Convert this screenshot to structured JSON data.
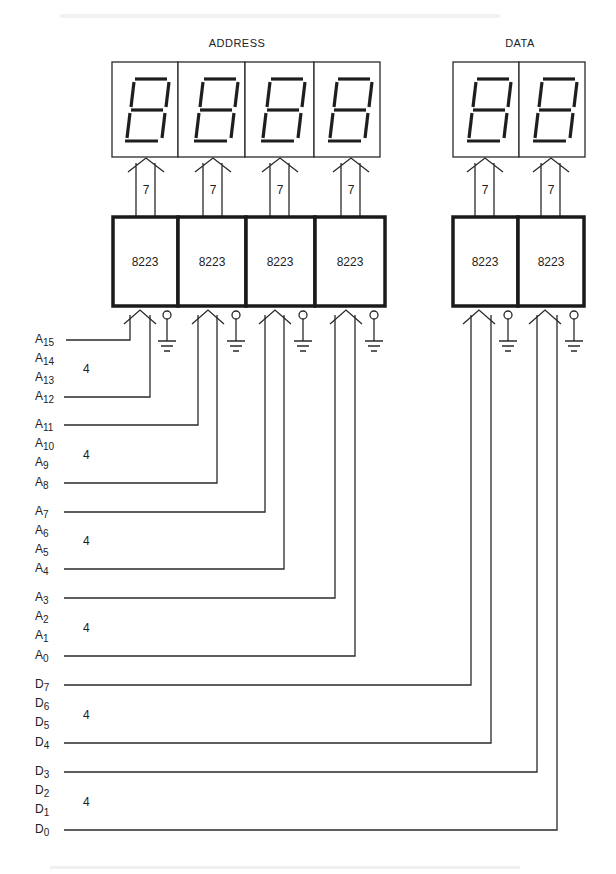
{
  "diagram": {
    "groups": {
      "address": {
        "label": "ADDRESS"
      },
      "data": {
        "label": "DATA"
      }
    },
    "displays": [
      {
        "group": "address",
        "digit": "8",
        "segments": "7-segment"
      },
      {
        "group": "address",
        "digit": "8",
        "segments": "7-segment"
      },
      {
        "group": "address",
        "digit": "8",
        "segments": "7-segment"
      },
      {
        "group": "address",
        "digit": "8",
        "segments": "7-segment"
      },
      {
        "group": "data",
        "digit": "8",
        "segments": "7-segment"
      },
      {
        "group": "data",
        "digit": "8",
        "segments": "7-segment"
      }
    ],
    "bus_width_to_display": [
      "7",
      "7",
      "7",
      "7",
      "7",
      "7"
    ],
    "chips": [
      {
        "label": "8223"
      },
      {
        "label": "8223"
      },
      {
        "label": "8223"
      },
      {
        "label": "8223"
      },
      {
        "label": "8223"
      },
      {
        "label": "8223"
      }
    ],
    "signal_groups": [
      {
        "bus_width": "4",
        "signals": [
          {
            "base": "A",
            "sub": "15"
          },
          {
            "base": "A",
            "sub": "14"
          },
          {
            "base": "A",
            "sub": "13"
          },
          {
            "base": "A",
            "sub": "12"
          }
        ]
      },
      {
        "bus_width": "4",
        "signals": [
          {
            "base": "A",
            "sub": "11"
          },
          {
            "base": "A",
            "sub": "10"
          },
          {
            "base": "A",
            "sub": "9"
          },
          {
            "base": "A",
            "sub": "8"
          }
        ]
      },
      {
        "bus_width": "4",
        "signals": [
          {
            "base": "A",
            "sub": "7"
          },
          {
            "base": "A",
            "sub": "6"
          },
          {
            "base": "A",
            "sub": "5"
          },
          {
            "base": "A",
            "sub": "4"
          }
        ]
      },
      {
        "bus_width": "4",
        "signals": [
          {
            "base": "A",
            "sub": "3"
          },
          {
            "base": "A",
            "sub": "2"
          },
          {
            "base": "A",
            "sub": "1"
          },
          {
            "base": "A",
            "sub": "0"
          }
        ]
      },
      {
        "bus_width": "4",
        "signals": [
          {
            "base": "D",
            "sub": "7"
          },
          {
            "base": "D",
            "sub": "6"
          },
          {
            "base": "D",
            "sub": "5"
          },
          {
            "base": "D",
            "sub": "4"
          }
        ]
      },
      {
        "bus_width": "4",
        "signals": [
          {
            "base": "D",
            "sub": "3"
          },
          {
            "base": "D",
            "sub": "2"
          },
          {
            "base": "D",
            "sub": "1"
          },
          {
            "base": "D",
            "sub": "0"
          }
        ]
      }
    ],
    "colors": {
      "ink": "#1e1e1e",
      "paper": "#ffffff"
    }
  }
}
